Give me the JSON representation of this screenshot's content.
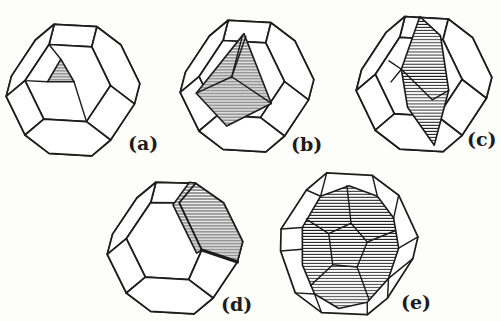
{
  "figure": {
    "background_color": "#fdfdfc",
    "ink_color": "#1c1c1c",
    "panels": [
      {
        "id": "a",
        "label": "(a)",
        "hatched_region": "small triangular facet left of center"
      },
      {
        "id": "b",
        "label": "(b)",
        "hatched_region": "large three-faced pyramidal region on the front face"
      },
      {
        "id": "c",
        "label": "(c)",
        "hatched_region": "tall vertical band of facets through the center"
      },
      {
        "id": "d",
        "label": "(d)",
        "hatched_region": "large upper-right hexagonal facet plus narrow step strip"
      },
      {
        "id": "e",
        "label": "(e)",
        "hatched_region": "nearly the whole crystal body inside an outer polyhedral shell"
      }
    ]
  }
}
